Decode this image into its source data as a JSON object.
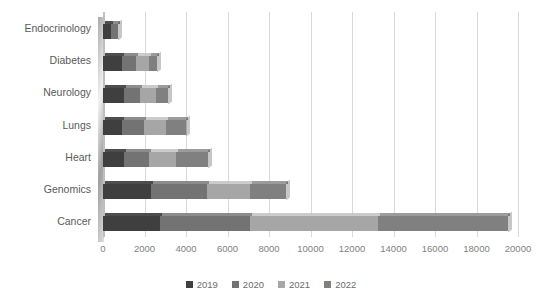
{
  "chart_data": {
    "type": "bar",
    "orientation": "horizontal",
    "stacked": true,
    "title": "",
    "subtitle": "",
    "xlabel": "",
    "ylabel": "",
    "categories": [
      "Endocrinology",
      "Diabetes",
      "Neurology",
      "Lungs",
      "Heart",
      "Genomics",
      "Cancer"
    ],
    "series": [
      {
        "name": "2019",
        "color": "#3f3f3f",
        "values": [
          400,
          900,
          1000,
          900,
          1000,
          2300,
          2750
        ]
      },
      {
        "name": "2020",
        "color": "#737373",
        "values": [
          300,
          700,
          800,
          1100,
          1200,
          2700,
          4350
        ]
      },
      {
        "name": "2021",
        "color": "#a6a6a6",
        "values": [
          0,
          600,
          750,
          1050,
          1300,
          2100,
          6150
        ]
      },
      {
        "name": "2022",
        "color": "#808080",
        "values": [
          0,
          400,
          600,
          950,
          1550,
          1700,
          6250
        ]
      }
    ],
    "totals": [
      700,
      2600,
      3150,
      4000,
      5050,
      8800,
      19500
    ],
    "xticks": [
      0,
      2000,
      4000,
      6000,
      8000,
      10000,
      12000,
      14000,
      16000,
      18000,
      20000
    ],
    "xlim": [
      0,
      20000
    ],
    "grid": "vertical",
    "legend_position": "bottom",
    "legend_entries": [
      "2019",
      "2020",
      "2021",
      "2022"
    ],
    "gridline_color": "#d9d9d9",
    "tick_label_color": "#7f7f7f",
    "category_label_color": "#5a5a5a",
    "background_color": "#ffffff",
    "style": "3d-effect"
  }
}
